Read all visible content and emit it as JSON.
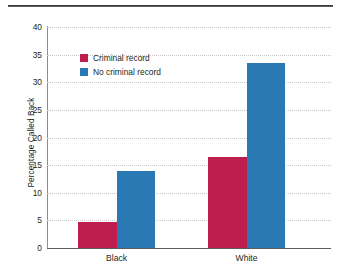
{
  "chart_data": {
    "type": "bar",
    "title": "",
    "xlabel": "",
    "ylabel": "Percentage Called Back",
    "categories": [
      "Black",
      "White"
    ],
    "series": [
      {
        "name": "Criminal record",
        "color": "#be1e4e",
        "values": [
          4.7,
          16.5
        ]
      },
      {
        "name": "No criminal record",
        "color": "#2b79b4",
        "values": [
          14.0,
          33.5
        ]
      }
    ],
    "ylim": [
      0,
      40
    ],
    "yticks": [
      0,
      5,
      10,
      15,
      20,
      25,
      30,
      35,
      40
    ],
    "ytick_labels": [
      "0",
      "5",
      "10",
      "15",
      "20",
      "25",
      "30",
      "35",
      "40"
    ],
    "grid": true,
    "grid_style": "dotted-horizontal",
    "legend_position": "upper-left-inside"
  },
  "figure": {
    "top_rule": "horizontal-rule",
    "background": "#ffffff"
  }
}
